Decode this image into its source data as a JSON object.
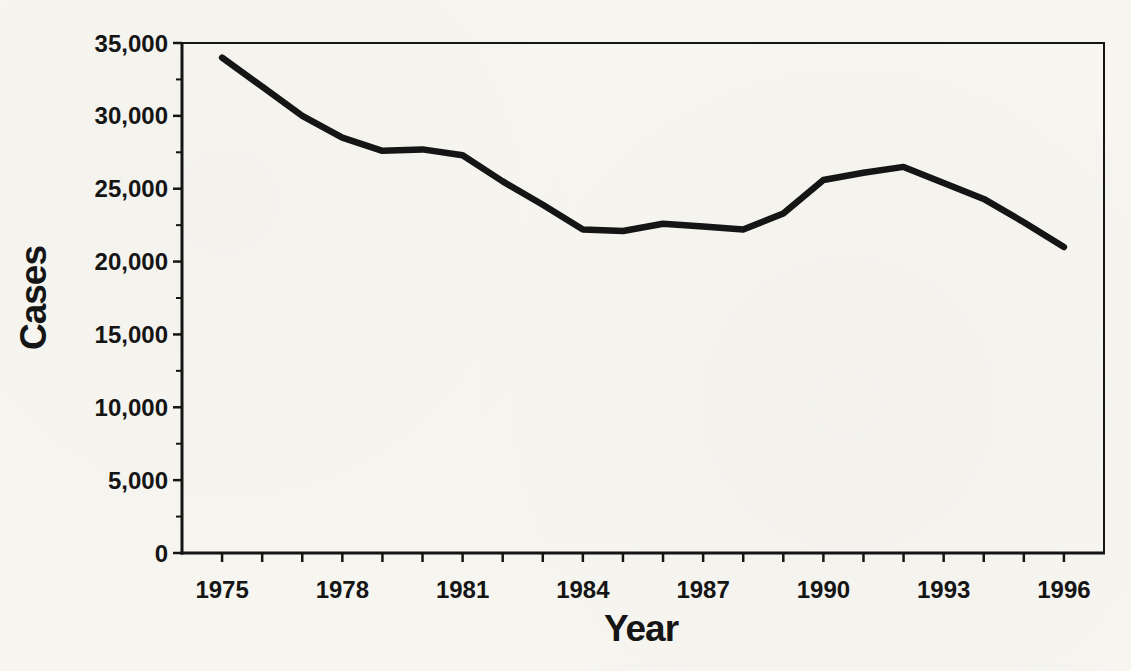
{
  "figure": {
    "background_color": "#f6f5f0",
    "ink_color": "#151515",
    "line_color": "#151515"
  },
  "chart_data": {
    "type": "line",
    "title": "",
    "xlabel": "Year",
    "ylabel": "Cases",
    "x": [
      1975,
      1976,
      1977,
      1978,
      1979,
      1980,
      1981,
      1982,
      1983,
      1984,
      1985,
      1986,
      1987,
      1988,
      1989,
      1990,
      1991,
      1992,
      1993,
      1994,
      1995,
      1996
    ],
    "values": [
      34000,
      32000,
      30000,
      28500,
      27600,
      27700,
      27300,
      25500,
      23900,
      22200,
      22100,
      22600,
      22400,
      22200,
      23300,
      25600,
      26100,
      26500,
      25400,
      24300,
      22700,
      21000
    ],
    "series_name": "Cases",
    "xlim": [
      1974,
      1997
    ],
    "ylim": [
      0,
      35000
    ],
    "grid": false,
    "legend": false,
    "plot_border": true,
    "x_major_ticks": [
      {
        "value": 1975,
        "label": "1975"
      },
      {
        "value": 1978,
        "label": "1978"
      },
      {
        "value": 1981,
        "label": "1981"
      },
      {
        "value": 1984,
        "label": "1984"
      },
      {
        "value": 1987,
        "label": "1987"
      },
      {
        "value": 1990,
        "label": "1990"
      },
      {
        "value": 1993,
        "label": "1993"
      },
      {
        "value": 1996,
        "label": "1996"
      }
    ],
    "x_minor_tick_every": 1,
    "y_major_ticks": [
      {
        "value": 0,
        "label": "0"
      },
      {
        "value": 5000,
        "label": "5,000"
      },
      {
        "value": 10000,
        "label": "10,000"
      },
      {
        "value": 15000,
        "label": "15,000"
      },
      {
        "value": 20000,
        "label": "20,000"
      },
      {
        "value": 25000,
        "label": "25,000"
      },
      {
        "value": 30000,
        "label": "30,000"
      },
      {
        "value": 35000,
        "label": "35,000"
      }
    ],
    "y_minor_tick_every": 2500
  }
}
